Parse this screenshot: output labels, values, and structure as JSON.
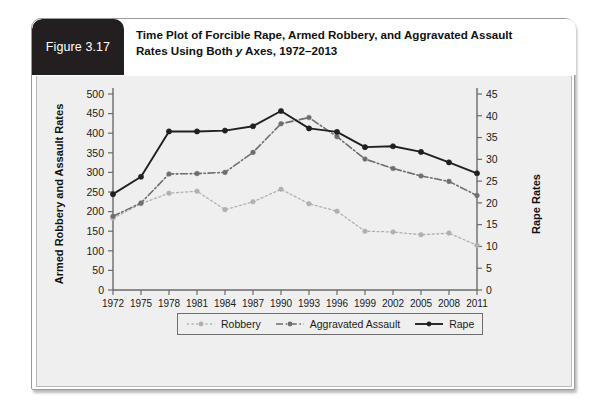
{
  "figure": {
    "tab_label": "Figure 3.17",
    "title_line1": "Time Plot of Forcible Rape, Armed Robbery, and Aggravated Assault",
    "title_line2_pre": "Rates Using Both ",
    "title_line2_italic": "y",
    "title_line2_post": " Axes, 1972–2013"
  },
  "axis_titles": {
    "left": "Armed Robbery and Assault Rates",
    "right": "Rape Rates"
  },
  "legend": {
    "items": [
      {
        "label": "Robbery",
        "style": "dotted",
        "color": "#b0b0b0"
      },
      {
        "label": "Aggravated Assault",
        "style": "dashdot",
        "color": "#6e6e6e"
      },
      {
        "label": "Rape",
        "style": "solid",
        "color": "#231f20"
      }
    ]
  },
  "chart_data": {
    "type": "line",
    "title": "Time Plot of Forcible Rape, Armed Robbery, and Aggravated Assault Rates Using Both y Axes, 1972–2013",
    "xlabel": "",
    "ylabel": "Armed Robbery and Assault Rates",
    "y2label": "Rape Rates",
    "grid": false,
    "legend_position": "bottom",
    "x": [
      1972,
      1975,
      1978,
      1981,
      1984,
      1987,
      1990,
      1993,
      1996,
      1999,
      2002,
      2005,
      2008,
      2011
    ],
    "categories": [
      "1972",
      "1975",
      "1978",
      "1981",
      "1984",
      "1987",
      "1990",
      "1993",
      "1996",
      "1999",
      "2002",
      "2005",
      "2008",
      "2011"
    ],
    "ylim": [
      0,
      500
    ],
    "yticks": [
      0,
      50,
      100,
      150,
      200,
      250,
      300,
      350,
      400,
      450,
      500
    ],
    "y2lim": [
      0,
      45
    ],
    "y2ticks": [
      0,
      5,
      10,
      15,
      20,
      25,
      30,
      35,
      40,
      45
    ],
    "series": [
      {
        "name": "Robbery",
        "axis": "left",
        "color": "#b0b0b0",
        "linestyle": "dotted",
        "values": [
          183,
          220,
          247,
          252,
          205,
          225,
          257,
          220,
          201,
          150,
          148,
          141,
          145,
          114
        ]
      },
      {
        "name": "Aggravated Assault",
        "axis": "left",
        "color": "#6e6e6e",
        "linestyle": "dashdot",
        "values": [
          188,
          222,
          296,
          297,
          300,
          351,
          424,
          440,
          391,
          334,
          310,
          291,
          277,
          241
        ]
      },
      {
        "name": "Rape",
        "axis": "right",
        "color": "#231f20",
        "linestyle": "solid",
        "values": [
          22.0,
          26.0,
          36.4,
          36.4,
          36.6,
          37.6,
          41.1,
          37.1,
          36.3,
          32.8,
          33.0,
          31.7,
          29.3,
          26.8
        ]
      }
    ]
  }
}
